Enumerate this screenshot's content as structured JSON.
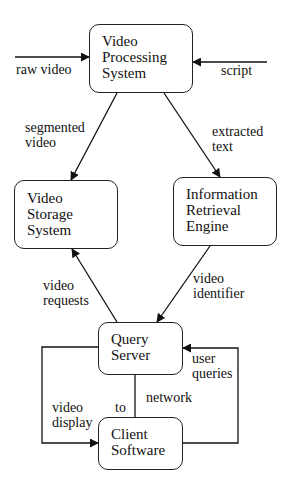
{
  "diagram": {
    "type": "data-flow block diagram",
    "nodes": [
      {
        "id": "vps",
        "label": "Video\nProcessing\nSystem"
      },
      {
        "id": "vss",
        "label": "Video\nStorage\nSystem"
      },
      {
        "id": "ire",
        "label": "Information\nRetrieval\nEngine"
      },
      {
        "id": "qs",
        "label": "Query\nServer"
      },
      {
        "id": "cs",
        "label": "Client\nSoftware"
      }
    ],
    "edges": [
      {
        "from": "external",
        "to": "vps",
        "label": "raw video"
      },
      {
        "from": "external",
        "to": "vps",
        "label": "script"
      },
      {
        "from": "vps",
        "to": "vss",
        "label": "segmented\nvideo"
      },
      {
        "from": "vps",
        "to": "ire",
        "label": "extracted\ntext"
      },
      {
        "from": "qs",
        "to": "vss",
        "label": "video\nrequests"
      },
      {
        "from": "ire",
        "to": "qs",
        "label": "video\nidentifier"
      },
      {
        "from": "qs",
        "to": "cs",
        "label": "video\ndisplay"
      },
      {
        "from": "cs",
        "to": "qs",
        "label": "user\nqueries"
      },
      {
        "from": "qs",
        "to": "cs",
        "label": "network",
        "note": "to"
      }
    ]
  },
  "labels": {
    "raw_video": "raw video",
    "script": "script",
    "segmented_video": "segmented\nvideo",
    "extracted_text": "extracted\ntext",
    "video_requests": "video\nrequests",
    "video_identifier": "video\nidentifier",
    "user_queries": "user\nqueries",
    "network": "network",
    "to": "to",
    "video_display": "video\ndisplay"
  }
}
